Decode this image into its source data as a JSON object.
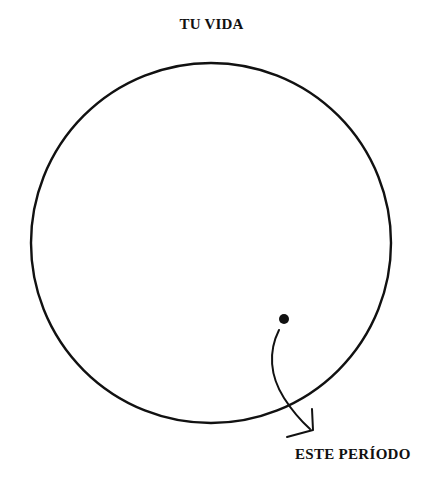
{
  "diagram": {
    "title": "TU VIDA",
    "pointer_label": "ESTE PERÍODO",
    "ink_color": "#111111",
    "background_color": "#ffffff"
  }
}
